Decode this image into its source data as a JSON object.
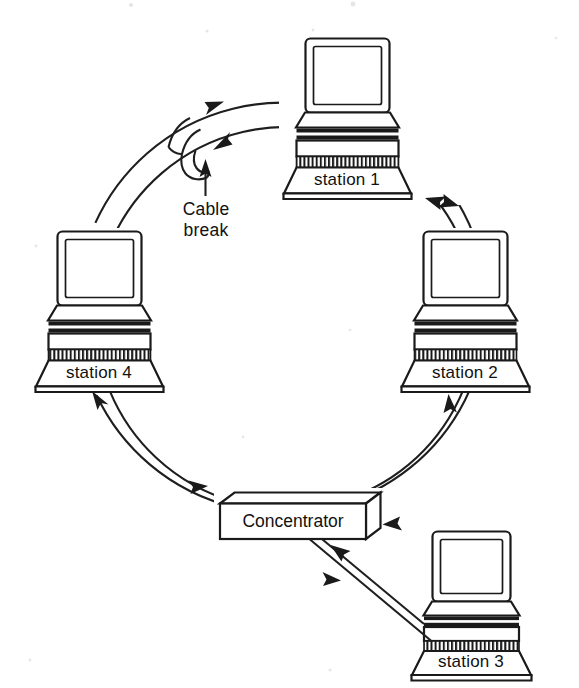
{
  "figure": {
    "background_color": "#ffffff",
    "ink_color": "#1a1a1a"
  },
  "nodes": {
    "station1": {
      "label": "station 1",
      "type": "workstation",
      "position": "top"
    },
    "station2": {
      "label": "station 2",
      "type": "workstation",
      "position": "right"
    },
    "station3": {
      "label": "station 3",
      "type": "workstation",
      "position": "bottom-right"
    },
    "station4": {
      "label": "station 4",
      "type": "workstation",
      "position": "left"
    },
    "concentrator": {
      "label": "Concentrator",
      "type": "device-box",
      "position": "bottom-center"
    }
  },
  "annotations": {
    "cable_break": {
      "line1": "Cable",
      "line2": "break",
      "pointer": "up-arrow"
    }
  },
  "icons": {
    "monitor": "monitor-icon",
    "keyboard": "keyboard-hatch-icon",
    "arrow": "arrowhead-icon",
    "box3d": "box-3d-icon"
  }
}
